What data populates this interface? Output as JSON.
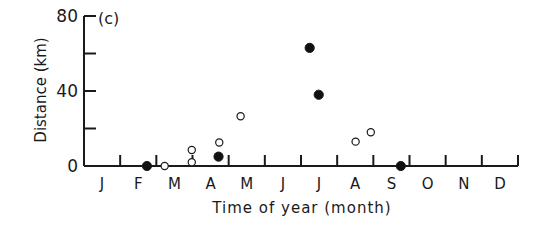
{
  "chart_data": {
    "type": "scatter",
    "panel_label": "(c)",
    "title": "",
    "xlabel": "Time of year (month)",
    "ylabel": "Distance (km)",
    "ylim": [
      0,
      80
    ],
    "yticks": [
      0,
      20,
      40,
      60,
      80
    ],
    "ytick_labels": [
      "0",
      "",
      "40",
      "",
      "80"
    ],
    "xlim": [
      0,
      12
    ],
    "x_tick_positions": [
      0,
      1,
      2,
      3,
      4,
      5,
      6,
      7,
      8,
      9,
      10,
      11,
      12
    ],
    "categories": [
      "J",
      "F",
      "M",
      "A",
      "M",
      "J",
      "J",
      "A",
      "S",
      "O",
      "N",
      "D"
    ],
    "grid": false,
    "legend": null,
    "series": [
      {
        "name": "filled",
        "marker": "filled-circle",
        "points": [
          {
            "x": 1.74,
            "y": 0
          },
          {
            "x": 3.72,
            "y": 5
          },
          {
            "x": 6.24,
            "y": 63
          },
          {
            "x": 6.49,
            "y": 38
          },
          {
            "x": 8.76,
            "y": 0
          }
        ]
      },
      {
        "name": "open",
        "marker": "open-circle",
        "points": [
          {
            "x": 2.23,
            "y": 0
          },
          {
            "x": 2.98,
            "y": 2
          },
          {
            "x": 2.98,
            "y": 8.5
          },
          {
            "x": 3.74,
            "y": 12.5
          },
          {
            "x": 4.33,
            "y": 26.5
          },
          {
            "x": 7.51,
            "y": 13
          },
          {
            "x": 7.93,
            "y": 18
          }
        ]
      }
    ]
  }
}
